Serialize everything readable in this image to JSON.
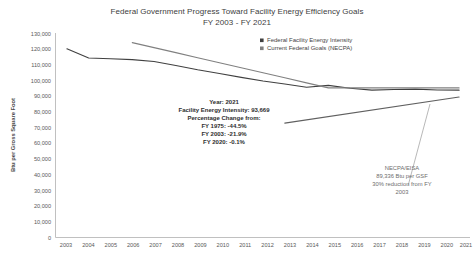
{
  "chart_data": {
    "type": "line",
    "title": "Federal Government Progress Toward Facility Energy Efficiency Goals",
    "subtitle": "FY 2003 - FY 2021",
    "xlabel": "",
    "ylabel": "Btu per Gross Square Foot",
    "ylim": [
      0,
      130000
    ],
    "ytick_labels": [
      "130,000",
      "120,000",
      "110,000",
      "100,000",
      "90,000",
      "80,000",
      "70,000",
      "60,000",
      "50,000",
      "40,000",
      "30,000",
      "20,000",
      "10,000",
      "0"
    ],
    "ytick_values": [
      130000,
      120000,
      110000,
      100000,
      90000,
      80000,
      70000,
      60000,
      50000,
      40000,
      30000,
      20000,
      10000,
      0
    ],
    "grid": false,
    "legend_position": "top-right",
    "categories": [
      "2003",
      "2004",
      "2005",
      "2006",
      "2007",
      "2008",
      "2009",
      "2010",
      "2011",
      "2012",
      "2013",
      "2014",
      "2015",
      "2016",
      "2017",
      "2018",
      "2019",
      "2020",
      "2021"
    ],
    "series": [
      {
        "name": "Federal Facility Energy Intensity",
        "color": "#404040",
        "x": [
          "2003",
          "2004",
          "2005",
          "2006",
          "2007",
          "2008",
          "2009",
          "2010",
          "2011",
          "2012",
          "2013",
          "2014",
          "2015",
          "2016",
          "2017",
          "2018",
          "2019",
          "2020",
          "2021"
        ],
        "values": [
          119929,
          114100,
          113600,
          113100,
          111900,
          109300,
          106600,
          104300,
          101800,
          99500,
          97600,
          95500,
          96700,
          94900,
          93700,
          94100,
          94300,
          93800,
          93669
        ]
      },
      {
        "name": "Current Federal Goals (NECPA)",
        "color": "#808080",
        "x": [
          "2006",
          "2007",
          "2008",
          "2009",
          "2010",
          "2011",
          "2012",
          "2013",
          "2014",
          "2015",
          "2016",
          "2017",
          "2018",
          "2019",
          "2020",
          "2021"
        ],
        "values": [
          123900,
          120700,
          117500,
          114300,
          111100,
          107900,
          104700,
          101500,
          98300,
          95100,
          95100,
          95100,
          95100,
          95100,
          95100,
          95100
        ]
      },
      {
        "name": "NECPA Target Trajectory",
        "color": "#606060",
        "x": [
          "2013",
          "2021"
        ],
        "values": [
          72700,
          89336
        ]
      }
    ],
    "annotations": [
      {
        "name": "facility-intensity-callout",
        "lines": [
          "Year: 2021",
          "Facility Energy Intensity: 93,669",
          "Percentage Change from:",
          "FY 1975: -44.5%",
          "FY 2003: -21.9%",
          "FY 2020: -0.1%"
        ]
      },
      {
        "name": "necpa-eisa-callout",
        "lines": [
          "NECPA/EISA",
          "89,336 Btu per GSF",
          "30% reduction from FY",
          "2003"
        ]
      }
    ]
  }
}
